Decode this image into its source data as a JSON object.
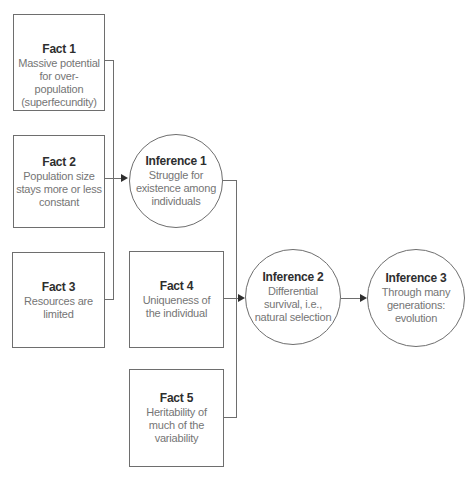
{
  "colors": {
    "background": "#ffffff",
    "line": "#6e6e6e",
    "title_text": "#2e2e2e",
    "body_text": "#757575",
    "arrow": "#2e2e2e"
  },
  "diagram": {
    "nodes": {
      "fact1": {
        "shape": "rect",
        "title": "Fact 1",
        "body": "Massive potential\nfor over-\npopulation\n(superfecundity)"
      },
      "fact2": {
        "shape": "rect",
        "title": "Fact 2",
        "body": "Population size\nstays more or less\nconstant"
      },
      "fact3": {
        "shape": "rect",
        "title": "Fact 3",
        "body": "Resources are\nlimited"
      },
      "fact4": {
        "shape": "rect",
        "title": "Fact 4",
        "body": "Uniqueness of\nthe individual"
      },
      "fact5": {
        "shape": "rect",
        "title": "Fact 5",
        "body": "Heritability of\nmuch of the\nvariability"
      },
      "inference1": {
        "shape": "circle",
        "title": "Inference 1",
        "body": "Struggle for\nexistence among\nindividuals"
      },
      "inference2": {
        "shape": "circle",
        "title": "Inference 2",
        "body": "Differential\nsurvival, i.e.,\nnatural selection"
      },
      "inference3": {
        "shape": "circle",
        "title": "Inference 3",
        "body": "Through many\ngenerations:\nevolution"
      }
    },
    "edges": [
      {
        "from": "fact1",
        "to": "inference1",
        "via": "left-collector",
        "arrow": false
      },
      {
        "from": "fact2",
        "to": "inference1",
        "via": "direct",
        "arrow": true
      },
      {
        "from": "fact3",
        "to": "inference1",
        "via": "left-collector",
        "arrow": false
      },
      {
        "from": "inference1",
        "to": "inference2",
        "via": "right-collector",
        "arrow": false
      },
      {
        "from": "fact4",
        "to": "inference2",
        "via": "direct",
        "arrow": true
      },
      {
        "from": "fact5",
        "to": "inference2",
        "via": "right-collector",
        "arrow": false
      },
      {
        "from": "inference2",
        "to": "inference3",
        "via": "direct",
        "arrow": true
      }
    ]
  }
}
